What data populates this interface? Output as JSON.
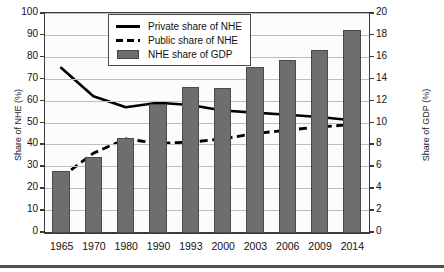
{
  "axes": {
    "y_left_title": "Share of NHE (%)",
    "y_right_title": "Share of GDP (%)",
    "y_left_ticks": [
      "100",
      "90",
      "80",
      "70",
      "60",
      "50",
      "40",
      "30",
      "20",
      "10",
      "0"
    ],
    "y_right_ticks": [
      "20",
      "18",
      "16",
      "14",
      "12",
      "10",
      "8",
      "6",
      "4",
      "2",
      "0"
    ]
  },
  "legend": {
    "items": [
      {
        "label": "Private share of NHE",
        "symbol": "solid-line",
        "color": "#000000"
      },
      {
        "label": "Public share of NHE",
        "symbol": "dashed-line",
        "color": "#000000"
      },
      {
        "label": "NHE share of GDP",
        "symbol": "filled-square",
        "color": "#6e6e6e"
      }
    ]
  },
  "chart_data": {
    "type": "bar",
    "title": "",
    "xlabel": "",
    "ylabel": "Share of NHE (%)",
    "y2label": "Share of GDP (%)",
    "ylim": [
      0,
      100
    ],
    "y2lim": [
      0,
      20
    ],
    "grid": true,
    "legend_position": "top-center",
    "categories": [
      "1965",
      "1970",
      "1980",
      "1990",
      "1993",
      "2000",
      "2003",
      "2006",
      "2009",
      "2014"
    ],
    "series": [
      {
        "name": "NHE share of GDP",
        "type": "bar",
        "axis": "right",
        "unit": "%",
        "color": "#6e6e6e",
        "values": [
          5.7,
          6.9,
          8.7,
          11.8,
          13.3,
          13.2,
          15.2,
          15.8,
          16.7,
          18.5
        ]
      },
      {
        "name": "Private share of NHE",
        "type": "line",
        "axis": "left",
        "unit": "%",
        "color": "#000000",
        "style": "solid",
        "values": [
          75,
          62,
          57,
          59,
          58,
          55.5,
          54.5,
          53.5,
          52.5,
          51
        ]
      },
      {
        "name": "Public share of NHE",
        "type": "line",
        "axis": "left",
        "unit": "%",
        "color": "#000000",
        "style": "dashed",
        "values": [
          25,
          36,
          42.5,
          40.5,
          41,
          42.5,
          45,
          46.5,
          48,
          49
        ]
      }
    ]
  }
}
